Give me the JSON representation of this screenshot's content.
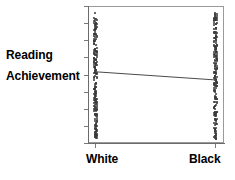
{
  "chart_data": {
    "type": "scatter",
    "title": "",
    "xlabel": "",
    "ylabel": "Reading Achievement",
    "ylabel_lines": [
      "Reading",
      "Achievement"
    ],
    "categories": [
      "White",
      "Black"
    ],
    "grid": false,
    "legend": "none",
    "axis": {
      "x_tick_labels": [
        "White",
        "Black"
      ],
      "y_tick_labels": [],
      "y_tick_count": 9,
      "x_tick_count": 2,
      "ylim": [
        0,
        100
      ],
      "xlim": [
        0,
        1
      ]
    },
    "series": [
      {
        "name": "White",
        "x_category": "White",
        "point_count": 110,
        "y_min": 8,
        "y_max": 96,
        "color": "#3a3a3a"
      },
      {
        "name": "Black",
        "x_category": "Black",
        "point_count": 110,
        "y_min": 8,
        "y_max": 96,
        "color": "#3a3a3a"
      }
    ],
    "regression_line": {
      "name": "fitted-line",
      "x_start_category": "White",
      "x_end_category": "Black",
      "y_start": 52,
      "y_end": 46,
      "slope": "negative",
      "color": "#4a4a4a"
    },
    "annotation": "Mean reading achievement is slightly higher for White than Black; distributions overlap almost completely."
  },
  "labels": {
    "y_caption_line1": "Reading",
    "y_caption_line2": "Achievement",
    "x_white": "White",
    "x_black": "Black"
  },
  "colors": {
    "frame": "#9a9a9a",
    "spine": "#6b6b6b",
    "tick": "#7a7a7a",
    "point": "#3a3a3a",
    "line": "#4a4a4a",
    "text": "#000000",
    "background": "#ffffff"
  }
}
